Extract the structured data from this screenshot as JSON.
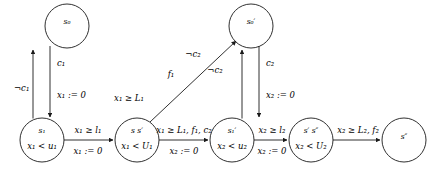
{
  "diagram": {
    "kind": "timed-automaton",
    "title": "",
    "stroke_color": "#1a1a1a",
    "text_color": "#000000",
    "background": "#ffffff"
  },
  "states": [
    {
      "id": "s0",
      "name": "s₀",
      "invariant": "",
      "cx": 67,
      "cy": 26,
      "r": 22
    },
    {
      "id": "s0p",
      "name": "s₀′",
      "invariant": "",
      "cx": 251,
      "cy": 26,
      "r": 22
    },
    {
      "id": "s1",
      "name": "s₁",
      "invariant": "x₁ < u₁",
      "cx": 42,
      "cy": 140,
      "r": 22
    },
    {
      "id": "ssp",
      "name": "s s′",
      "invariant": "x₁ < U₁",
      "cx": 137,
      "cy": 140,
      "r": 22
    },
    {
      "id": "s1p",
      "name": "s₁′",
      "invariant": "x₂ < u₂",
      "cx": 232,
      "cy": 140,
      "r": 22
    },
    {
      "id": "spspp",
      "name": "s′ s″",
      "invariant": "x₂ < U₂",
      "cx": 311,
      "cy": 140,
      "r": 22
    },
    {
      "id": "spp",
      "name": "s″",
      "invariant": "",
      "cx": 404,
      "cy": 140,
      "r": 22
    }
  ],
  "edges": [
    {
      "id": "e-s1-to-s0",
      "from": "s1",
      "to": "s0",
      "guard": "¬c₁",
      "assignment": "",
      "label_x": 14,
      "label_y": 89
    },
    {
      "id": "e-s0-to-s1",
      "from": "s0",
      "to": "s1",
      "guard": "c₁",
      "assignment": "x₁ := 0",
      "guard_x": 58,
      "guard_y": 64,
      "assign_x": 58,
      "assign_y": 96
    },
    {
      "id": "e-s1-to-ssp",
      "from": "s1",
      "to": "ssp",
      "guard": "x₁ ≥ l₁",
      "assignment": "x₁ := 0",
      "guard_x": 88,
      "guard_y": 130,
      "assign_x": 88,
      "assign_y": 151
    },
    {
      "id": "e-ssp-to-s0p",
      "from": "ssp",
      "to": "s0p",
      "guard": "x₁ ≥ L₁",
      "event": "f₁",
      "condition": "¬c₂",
      "guard_x": 129,
      "guard_y": 98,
      "event_x": 171,
      "event_y": 74,
      "cond_x": 193,
      "cond_y": 54
    },
    {
      "id": "e-ssp-to-s1p",
      "from": "ssp",
      "to": "s1p",
      "guard": "x₁ ≥ L₁, f₁, c₂",
      "assignment": "x₂ := 0",
      "guard_x": 184,
      "guard_y": 130,
      "assign_x": 184,
      "assign_y": 151
    },
    {
      "id": "e-s1p-to-s0p",
      "from": "s1p",
      "to": "s0p",
      "guard": "¬c₂",
      "assignment": "",
      "label_x": 215,
      "label_y": 70
    },
    {
      "id": "e-s0p-to-s1p",
      "from": "s0p",
      "to": "s1p",
      "guard": "c₂",
      "assignment": "x₂ := 0",
      "guard_x": 246,
      "guard_y": 64,
      "assign_x": 246,
      "assign_y": 96
    },
    {
      "id": "e-s1p-to-spspp",
      "from": "s1p",
      "to": "spspp",
      "guard": "x₂ ≥ l₂",
      "assignment": "x₂ := 0",
      "guard_x": 272,
      "guard_y": 130,
      "assign_x": 272,
      "assign_y": 151
    },
    {
      "id": "e-spspp-to-spp",
      "from": "spspp",
      "to": "spp",
      "guard": "x₂ ≥ L₂, f₂",
      "assignment": "",
      "guard_x": 358,
      "guard_y": 130
    }
  ]
}
